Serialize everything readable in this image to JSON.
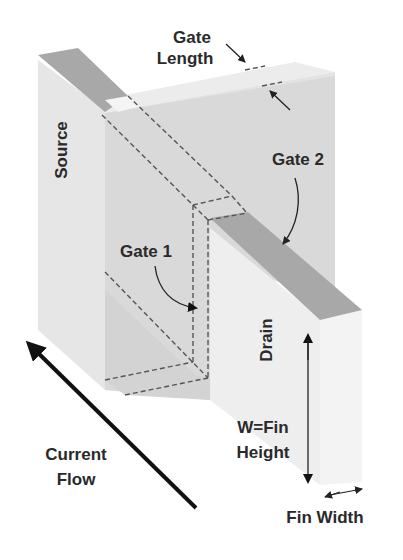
{
  "diagram": {
    "labels": {
      "gate_length_line1": "Gate",
      "gate_length_line2": "Length",
      "source": "Source",
      "gate_2": "Gate 2",
      "gate_1": "Gate 1",
      "drain": "Drain",
      "current_flow_line1": "Current",
      "current_flow_line2": "Flow",
      "fin_height_line1": "W=Fin",
      "fin_height_line2": "Height",
      "fin_width": "Fin Width"
    },
    "colors": {
      "background": "#ffffff",
      "gate_face": "#d9d9d9",
      "gate_top": "#ececec",
      "source_face": "#e6e6e6",
      "fin_top_strip": "#a8a8a8",
      "drain_front": "#eeeeee",
      "drain_side": "#f2f2f2",
      "gate1_face": "#d6d6d6",
      "text": "#2a2a2a",
      "arrow": "#111111",
      "dashed": "#555555"
    }
  }
}
